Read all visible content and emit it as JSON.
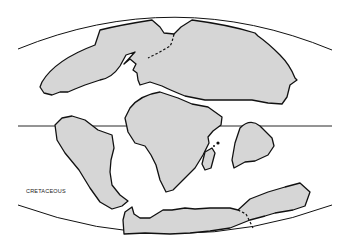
{
  "map": {
    "period_label": "CRETACEOUS",
    "projection": "elliptical world map",
    "colors": {
      "land": "#d6d6d6",
      "outline": "#111111",
      "ocean": "#ffffff"
    },
    "landmasses": [
      "North America / Eurasia (Laurasia)",
      "Africa",
      "South America",
      "India",
      "Madagascar",
      "Antarctica",
      "Australia"
    ],
    "features": [
      "equator line",
      "map border arcs",
      "dashed plate boundaries"
    ]
  }
}
